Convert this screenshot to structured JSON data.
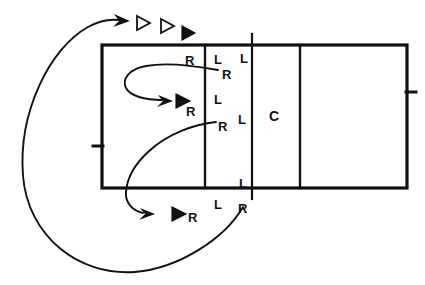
{
  "diagram": {
    "ink_color": "#111111",
    "background_color": "#ffffff"
  },
  "court": {
    "outline": {
      "x": 102,
      "y": 45,
      "width": 305,
      "height": 143
    },
    "vertical_lines": [
      205,
      252,
      300
    ],
    "net_line_x": 252,
    "left_tick_y": 146,
    "right_tick_y": 92
  },
  "player_markers": {
    "triangles_open": [
      "triangle-open-1",
      "triangle-open-2"
    ],
    "triangles_solid": [
      "triangle-solid-top",
      "triangle-solid-middle",
      "triangle-solid-bottom"
    ]
  },
  "labels": [
    {
      "name": "label-r-top-left",
      "text": "R",
      "x": 185,
      "y": 54,
      "size": 13
    },
    {
      "name": "label-l-top-mid",
      "text": "L",
      "x": 214,
      "y": 53,
      "size": 13
    },
    {
      "name": "label-l-top-right",
      "text": "L",
      "x": 240,
      "y": 52,
      "size": 13
    },
    {
      "name": "label-r-upper-inner",
      "text": "R",
      "x": 222,
      "y": 68,
      "size": 13
    },
    {
      "name": "label-l-middle",
      "text": "L",
      "x": 214,
      "y": 93,
      "size": 13
    },
    {
      "name": "label-r-middle",
      "text": "R",
      "x": 186,
      "y": 105,
      "size": 13
    },
    {
      "name": "label-r-lower-inner",
      "text": "R",
      "x": 218,
      "y": 120,
      "size": 13
    },
    {
      "name": "label-l-lower-inner",
      "text": "L",
      "x": 238,
      "y": 113,
      "size": 13
    },
    {
      "name": "label-c-center",
      "text": "C",
      "x": 269,
      "y": 109,
      "size": 14
    },
    {
      "name": "label-l-bottom-inner",
      "text": "L",
      "x": 239,
      "y": 177,
      "size": 13
    },
    {
      "name": "label-l-bottom",
      "text": "L",
      "x": 214,
      "y": 198,
      "size": 13
    },
    {
      "name": "label-r-bottom-right",
      "text": "R",
      "x": 238,
      "y": 202,
      "size": 13
    },
    {
      "name": "label-r-bottom-left",
      "text": "R",
      "x": 188,
      "y": 211,
      "size": 13
    }
  ],
  "motion_paths": [
    {
      "name": "outer-sweep-path",
      "description": "Large sweeping curve from bottom-right around the left side to the top arrow"
    },
    {
      "name": "upper-loop-path",
      "description": "Loop from upper R label curving left then back right to arrow"
    },
    {
      "name": "lower-sweep-path",
      "description": "Curve from mid-right R label sweeping down-left to bottom arrow"
    }
  ]
}
